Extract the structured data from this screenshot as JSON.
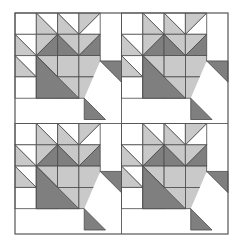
{
  "figure": {
    "type": "quilt-block-diagram",
    "canvas_width": 240,
    "canvas_height": 247
  },
  "palette": {
    "background": "#ffffff",
    "white_patch": "#ffffff",
    "light_gray_patch": "#c9c9c9",
    "dark_gray_patch": "#7f7f7f",
    "outline": "#4a4a4a",
    "border": "#555555"
  },
  "layout": {
    "border": {
      "x": 15,
      "y": 13,
      "width": 213,
      "height": 221,
      "stroke_width": 1.2
    },
    "grid_rows": 2,
    "grid_cols": 2,
    "block_size": 106.5,
    "cell_size": 21.3,
    "block_origins": [
      {
        "name": "block-top-left",
        "x": 15,
        "y": 13
      },
      {
        "name": "block-top-right",
        "x": 121.5,
        "y": 13
      },
      {
        "name": "block-bottom-left",
        "x": 15,
        "y": 123.5
      },
      {
        "name": "block-bottom-right",
        "x": 121.5,
        "y": 123.5
      }
    ],
    "divider_lines": [
      {
        "name": "vertical-center-divider",
        "x1": 121.5,
        "y1": 13,
        "x2": 121.5,
        "y2": 234
      },
      {
        "name": "horizontal-center-divider",
        "x1": 15,
        "y1": 123.5,
        "x2": 228,
        "y2": 123.5
      }
    ]
  },
  "block_pattern": {
    "name": "maple-leaf-block",
    "grid": 4,
    "unit_note": "Each cell is one 4-patch grid unit. 'hst' = half square triangle, orientation gives which corner the first color fills.",
    "patches": [
      {
        "id": "r0c0",
        "row": 0,
        "col": 0,
        "type": "plain",
        "fill": "white"
      },
      {
        "id": "r0c1",
        "row": 0,
        "col": 1,
        "type": "hst",
        "fill_a": "light",
        "fill_b": "white",
        "diag": "tl-br",
        "a_corner": "bottom-left"
      },
      {
        "id": "r0c2",
        "row": 0,
        "col": 2,
        "type": "hst",
        "fill_a": "light",
        "fill_b": "white",
        "diag": "tl-br",
        "a_corner": "bottom-left"
      },
      {
        "id": "r0c3",
        "row": 0,
        "col": 3,
        "type": "hst",
        "fill_a": "light",
        "fill_b": "white",
        "diag": "tr-bl",
        "a_corner": "bottom-left"
      },
      {
        "id": "r1c0",
        "row": 1,
        "col": 0,
        "type": "hst",
        "fill_a": "light",
        "fill_b": "white",
        "diag": "tl-br",
        "a_corner": "bottom-left"
      },
      {
        "id": "r1c1",
        "row": 1,
        "col": 1,
        "type": "hst",
        "fill_a": "dark",
        "fill_b": "light",
        "diag": "tr-bl",
        "a_corner": "bottom-right"
      },
      {
        "id": "r1c2",
        "row": 1,
        "col": 2,
        "type": "hst",
        "fill_a": "dark",
        "fill_b": "light",
        "diag": "tl-br",
        "a_corner": "bottom-left"
      },
      {
        "id": "r1c3",
        "row": 1,
        "col": 3,
        "type": "hst",
        "fill_a": "dark",
        "fill_b": "light",
        "diag": "tr-bl",
        "a_corner": "bottom-right"
      },
      {
        "id": "r2c0",
        "row": 2,
        "col": 0,
        "type": "hst",
        "fill_a": "light",
        "fill_b": "white",
        "diag": "tl-br",
        "a_corner": "bottom-left"
      },
      {
        "id": "r2c1",
        "row": 2,
        "col": 1,
        "type": "hst",
        "fill_a": "dark",
        "fill_b": "light",
        "diag": "tl-br",
        "a_corner": "bottom-left"
      },
      {
        "id": "r2c2",
        "row": 2,
        "col": 2,
        "type": "plain",
        "fill": "light"
      },
      {
        "id": "r2c3",
        "row": 2,
        "col": 3,
        "type": "plain",
        "fill": "light"
      },
      {
        "id": "r3c0",
        "row": 3,
        "col": 0,
        "type": "plain",
        "fill": "white"
      },
      {
        "id": "r3c1",
        "row": 3,
        "col": 1,
        "type": "hst",
        "fill_a": "light",
        "fill_b": "dark",
        "diag": "tl-br",
        "a_corner": "top-right"
      },
      {
        "id": "r3c2",
        "row": 3,
        "col": 2,
        "type": "plain",
        "fill": "light"
      },
      {
        "id": "r3c3",
        "row": 3,
        "col": 3,
        "type": "plain",
        "fill": "light"
      }
    ],
    "leaf_diagonal": {
      "name": "leaf-center-diagonal",
      "note": "Dark diagonal sweeping from upper-left of the 2x2 light square down to lower-right",
      "points": "1,4 1,2 3,4"
    },
    "stem": {
      "name": "stem-unit",
      "note": "Dark triangular stem extending below and right of the block body",
      "polygons": [
        {
          "id": "stem-right",
          "points": "4,2.25 5,2.25 5,3.25"
        },
        {
          "id": "stem-bottom",
          "points": "3.25,4 4.25,5 3.25,5"
        },
        {
          "id": "stem-link",
          "points": "4,2.25 5,3.25 4.25,5 3.25,4"
        }
      ]
    }
  }
}
